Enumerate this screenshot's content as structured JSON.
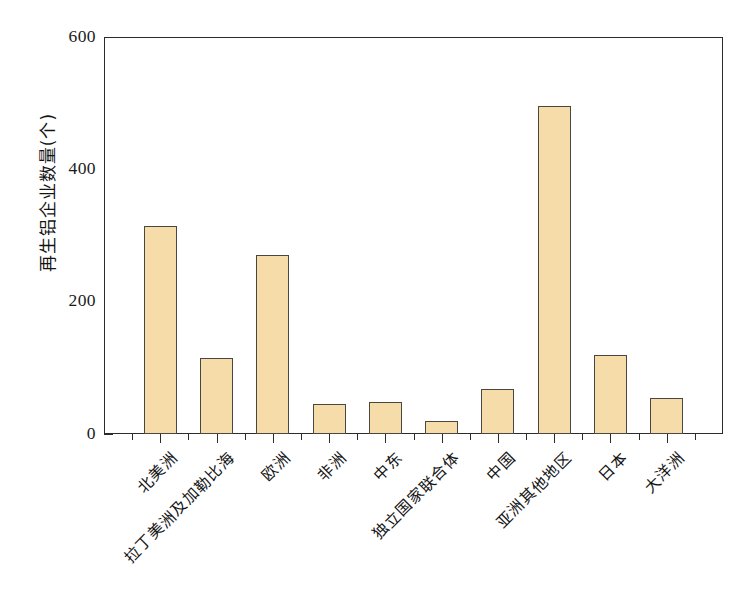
{
  "chart_data": {
    "type": "bar",
    "title": "",
    "xlabel": "",
    "ylabel": "再生铝企业数量(个)",
    "ylim": [
      0,
      600
    ],
    "yticks": [
      0,
      200,
      400,
      600
    ],
    "yminorticks": [
      100,
      300,
      500
    ],
    "ytick_labels": [
      "0",
      "200",
      "400",
      "600"
    ],
    "grid": false,
    "legend": null,
    "bar_fill_color": "#F5DCA8",
    "bar_edge_color": "#4A4741",
    "axis_color": "#2B2B2B",
    "categories": [
      "北美洲",
      "拉丁美洲及加勒比海",
      "欧洲",
      "非洲",
      "中东",
      "独立国家联合体",
      "中国",
      "亚洲其他地区",
      "日本",
      "大洋洲"
    ],
    "values": [
      315,
      115,
      270,
      45,
      48,
      20,
      68,
      495,
      120,
      55
    ]
  }
}
